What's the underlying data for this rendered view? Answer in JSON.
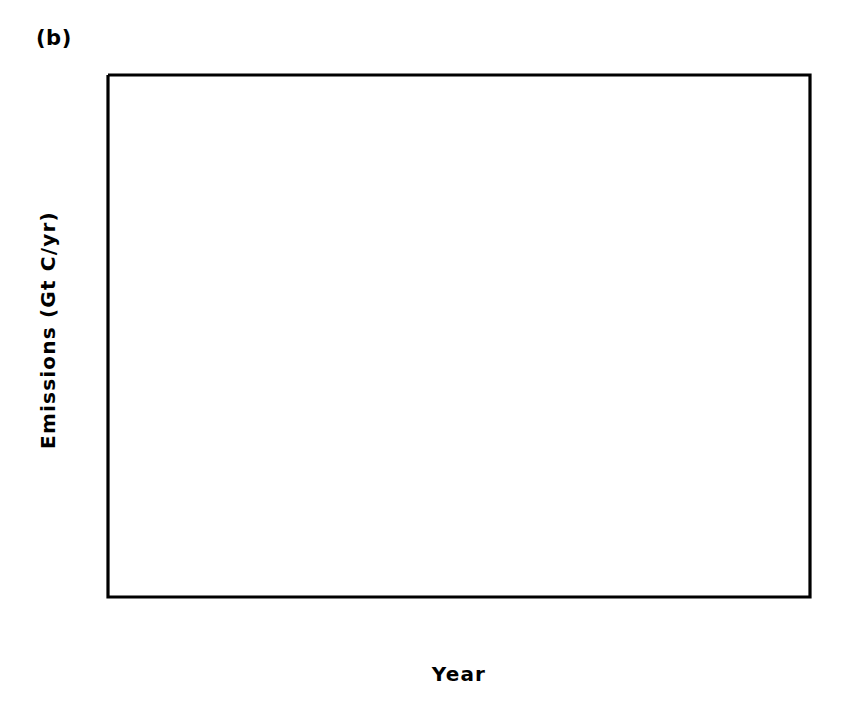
{
  "figure": {
    "panel_label": "(b)",
    "background_color": "#ffffff",
    "line_color": "#000000"
  },
  "chart_data": {
    "type": "line",
    "title": "(b)",
    "xlabel": "Year",
    "ylabel": "Emissions (Gt C/yr)",
    "xlim": [
      1950,
      2050
    ],
    "ylim": [
      -2,
      12
    ],
    "xticks": [
      1950,
      1970,
      1990,
      2010,
      2030,
      2050
    ],
    "xtick_labels": [
      "1950",
      "1970",
      "1990",
      "2010",
      "2030",
      "2050"
    ],
    "xminor_step": 5,
    "yticks": [
      -2,
      0,
      2,
      4,
      6,
      8,
      10,
      12
    ],
    "ytick_labels": [
      "-2",
      "0",
      "2",
      "4",
      "6",
      "8",
      "10",
      "12"
    ],
    "yminor_step": 1,
    "grid": false,
    "legend": "none",
    "annotations": [
      {
        "name": "present-day-marker",
        "type": "vline",
        "x": 1990,
        "style": "dotted",
        "label": ""
      }
    ],
    "series": [
      {
        "name": "fossil-fuel-emissions-scenario",
        "style": "solid",
        "x": [
          1950,
          1955,
          1960,
          1965,
          1970,
          1975,
          1980,
          1985,
          1990,
          1995,
          2000,
          2005,
          2010,
          2015,
          2020,
          2025,
          2030,
          2035,
          2040,
          2045,
          2050
        ],
        "y": [
          1.6,
          1.9,
          2.3,
          2.9,
          3.6,
          4.2,
          4.7,
          5.2,
          5.9,
          6.0,
          5.95,
          5.7,
          5.4,
          5.0,
          4.6,
          4.2,
          3.9,
          3.6,
          3.3,
          3.0,
          2.7
        ]
      },
      {
        "name": "alternative-emissions-scenario",
        "style": "dashed",
        "x": [
          1972,
          1975,
          1980,
          1985,
          1990,
          1995,
          2000,
          2005,
          2010,
          2015,
          2020,
          2025,
          2030,
          2035,
          2040,
          2045,
          2050
        ],
        "y": [
          4.3,
          4.9,
          6.3,
          7.9,
          9.65,
          8.6,
          7.5,
          6.3,
          5.0,
          4.0,
          3.3,
          2.9,
          2.6,
          2.4,
          2.25,
          2.1,
          2.0
        ]
      },
      {
        "name": "land-use-change-flux",
        "style": "dash-dot",
        "x": [
          1950,
          1953,
          1956,
          1959,
          1962,
          1965,
          1968,
          1971,
          1974,
          1977,
          1980,
          1983,
          1986,
          1988,
          1990
        ],
        "y": [
          0.02,
          -0.05,
          -0.06,
          -0.04,
          -0.03,
          -0.04,
          -0.1,
          -0.16,
          -0.2,
          -0.14,
          -0.17,
          -0.05,
          0.12,
          0.12,
          0.0
        ]
      }
    ]
  }
}
